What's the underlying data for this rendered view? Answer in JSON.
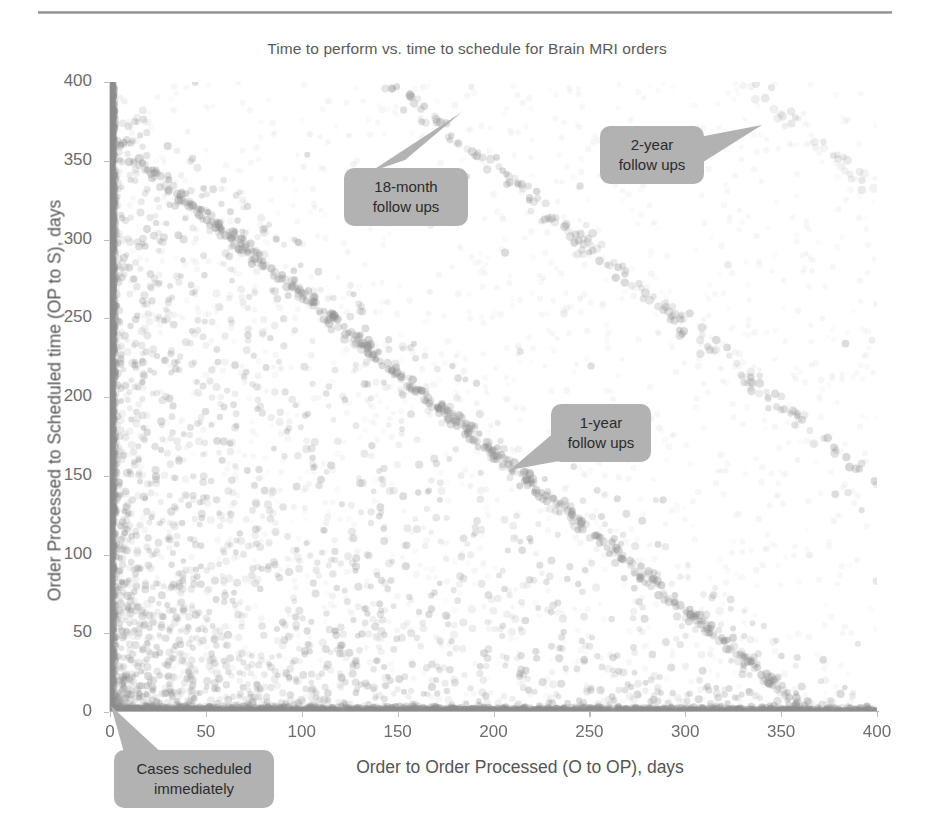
{
  "figure": {
    "title": "Time to perform vs. time to schedule for Brain MRI orders",
    "rule_color": "#a8a8a8",
    "point_color": "#8d8d8d",
    "callout_fill": "#b2b2b2",
    "axis_color": "#b4b4b4"
  },
  "chart_data": {
    "type": "scatter",
    "title": "Time to perform vs. time to schedule for Brain MRI orders",
    "xlabel": "Order to Order Processed (O to OP), days",
    "ylabel": "Order Processed to Scheduled time (OP to S), days",
    "xlim": [
      0,
      400
    ],
    "ylim": [
      0,
      400
    ],
    "xticks": [
      0,
      50,
      100,
      150,
      200,
      250,
      300,
      350,
      400
    ],
    "yticks": [
      0,
      50,
      100,
      150,
      200,
      250,
      300,
      350,
      400
    ],
    "grid": false,
    "legend": null,
    "marker": {
      "shape": "circle",
      "size_px": 7,
      "color": "#8d8d8d",
      "opacity": 0.32
    },
    "structures": [
      {
        "name": "cases-scheduled-immediately",
        "description": "Dense vertical cluster at x = 0 spanning full y range, and dense horizontal cluster at y = 0 spanning x range",
        "x_value": 0,
        "y_value": 0
      },
      {
        "name": "1-year-follow-ups",
        "description": "Anti-diagonal band where x + y is approximately 365 days",
        "sum_days": 365
      },
      {
        "name": "18-month-follow-ups",
        "description": "Anti-diagonal band where x + y is approximately 545 days",
        "sum_days": 545
      },
      {
        "name": "2-year-follow-ups",
        "description": "Anti-diagonal band where x + y is approximately 730 days",
        "sum_days": 730
      }
    ],
    "annotations": [
      {
        "id": "18month",
        "text_line1": "18-month",
        "text_line2": "follow ups",
        "points_to": {
          "x": 205,
          "y": 345
        }
      },
      {
        "id": "2year",
        "text_line1": "2-year",
        "text_line2": "follow ups",
        "points_to": {
          "x": 340,
          "y": 373
        }
      },
      {
        "id": "1year",
        "text_line1": "1-year",
        "text_line2": "follow ups",
        "points_to": {
          "x": 200,
          "y": 155
        }
      },
      {
        "id": "cases",
        "text_line1": "Cases scheduled",
        "text_line2": "immediately",
        "points_to": {
          "x": 2,
          "y": 4
        }
      }
    ]
  }
}
